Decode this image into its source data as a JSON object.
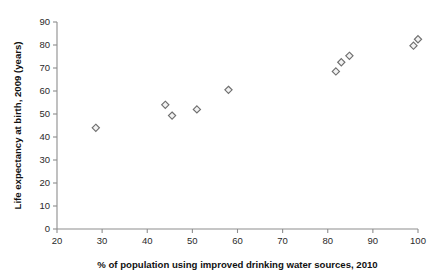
{
  "chart_data": {
    "type": "scatter",
    "title": "",
    "xlabel": "% of population using improved drinking water sources, 2010",
    "ylabel": "Life expectancy at birth, 2009 (years)",
    "xlim": [
      20,
      100
    ],
    "ylim": [
      0,
      90
    ],
    "xticks": [
      20,
      30,
      40,
      50,
      60,
      70,
      80,
      90,
      100
    ],
    "yticks": [
      0,
      10,
      20,
      30,
      40,
      50,
      60,
      70,
      80,
      90
    ],
    "xticklabels": [
      "20",
      "30",
      "40",
      "50",
      "60",
      "70",
      "80",
      "90",
      "100"
    ],
    "yticklabels": [
      "0",
      "10",
      "20",
      "30",
      "40",
      "50",
      "60",
      "70",
      "80",
      "90"
    ],
    "grid": false,
    "legend": false,
    "legend_position": "none",
    "marker": "diamond",
    "marker_color": "#6f6f6f",
    "marker_fill": "#f2f2f2",
    "background_color": "#ffffff",
    "axis_color": "#8d8d8d",
    "series": [
      {
        "name": "countries",
        "points": [
          {
            "x": 28.6,
            "y": 44.0
          },
          {
            "x": 44.0,
            "y": 54.0
          },
          {
            "x": 45.5,
            "y": 49.3
          },
          {
            "x": 51.0,
            "y": 52.0
          },
          {
            "x": 58.0,
            "y": 60.5
          },
          {
            "x": 81.8,
            "y": 68.5
          },
          {
            "x": 83.0,
            "y": 72.5
          },
          {
            "x": 84.8,
            "y": 75.3
          },
          {
            "x": 99.0,
            "y": 79.7
          },
          {
            "x": 100.0,
            "y": 82.5
          }
        ]
      }
    ]
  }
}
